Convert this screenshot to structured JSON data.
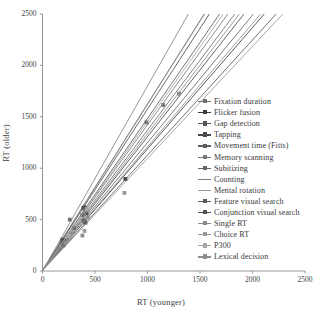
{
  "chart_data": {
    "type": "line",
    "title": "",
    "xlabel": "RT (younger)",
    "ylabel": "RT (older)",
    "xlim": [
      0,
      2500
    ],
    "ylim": [
      0,
      2500
    ],
    "xticks": [
      0,
      500,
      1000,
      1500,
      2000,
      2500
    ],
    "yticks": [
      0,
      500,
      1000,
      1500,
      2000,
      2500
    ],
    "grid": false,
    "legend_position": "right-inside",
    "series": [
      {
        "name": "Fixation duration",
        "color": "#6f6f6f",
        "slope": 1.36,
        "intercept": 10,
        "x_end": 300,
        "points": [
          [
            260,
            500
          ],
          [
            300,
            418
          ]
        ]
      },
      {
        "name": "Flicker fusion",
        "color": "#3c3c3c",
        "slope": 1.18,
        "intercept": 8,
        "x_end": 790,
        "points": [
          [
            190,
            280
          ],
          [
            400,
            480
          ],
          [
            790,
            895
          ]
        ]
      },
      {
        "name": "Gap detection",
        "color": "#555555",
        "slope": 1.62,
        "intercept": 5,
        "x_end": 400,
        "points": [
          [
            200,
            300
          ],
          [
            400,
            620
          ]
        ]
      },
      {
        "name": "Tapping",
        "color": "#4a4a4a",
        "slope": 1.3,
        "intercept": 6,
        "x_end": 420,
        "points": [
          [
            210,
            290
          ],
          [
            420,
            560
          ]
        ]
      },
      {
        "name": "Movement time (Fitts)",
        "color": "#5e5e5e",
        "slope": 1.48,
        "intercept": 4,
        "x_end": 380,
        "points": [
          [
            180,
            270
          ],
          [
            380,
            545
          ]
        ]
      },
      {
        "name": "Memory scanning",
        "color": "#7a7a7a",
        "slope": 1.41,
        "intercept": 12,
        "x_end": 1150,
        "points": [
          [
            400,
            580
          ],
          [
            1150,
            1615
          ]
        ]
      },
      {
        "name": "Subitizing",
        "color": "#666666",
        "slope": 1.24,
        "intercept": 9,
        "x_end": 990,
        "points": [
          [
            390,
            495
          ],
          [
            990,
            1445
          ]
        ]
      },
      {
        "name": "Counting",
        "color": "#828282",
        "slope": 1.8,
        "intercept": 0,
        "x_end": 1390,
        "points": []
      },
      {
        "name": "Mental rotation",
        "color": "#9a9a9a",
        "slope": 1.62,
        "intercept": 0,
        "x_end": 1545,
        "points": []
      },
      {
        "name": "Feature visual search",
        "color": "#5a5a5a",
        "slope": 1.12,
        "intercept": 7,
        "x_end": 410,
        "points": [
          [
            200,
            250
          ],
          [
            410,
            470
          ]
        ]
      },
      {
        "name": "Conjunction visual search",
        "color": "#4f4f4f",
        "slope": 1.57,
        "intercept": 5,
        "x_end": 390,
        "points": [
          [
            190,
            305
          ],
          [
            390,
            615
          ]
        ]
      },
      {
        "name": "Single RT",
        "color": "#8b8b8b",
        "slope": 1.33,
        "intercept": 6,
        "x_end": 1300,
        "points": [
          [
            380,
            345
          ],
          [
            1300,
            1725
          ]
        ]
      },
      {
        "name": "Choice RT",
        "color": "#999999",
        "slope": 1.09,
        "intercept": 5,
        "x_end": 780,
        "points": [
          [
            400,
            390
          ],
          [
            780,
            760
          ]
        ]
      },
      {
        "name": "P300",
        "color": "#a6a6a6",
        "slope": 1.45,
        "intercept": 4,
        "x_end": 420,
        "points": [
          [
            250,
            340
          ],
          [
            420,
            600
          ]
        ]
      },
      {
        "name": "Lexical decision",
        "color": "#8f8f8f",
        "slope": 1.2,
        "intercept": 8,
        "x_end": 430,
        "points": [
          [
            220,
            275
          ],
          [
            430,
            520
          ]
        ]
      }
    ]
  },
  "axes": {
    "x_tick_labels": [
      "0",
      "500",
      "1000",
      "1500",
      "2000",
      "2500"
    ],
    "y_tick_labels": [
      "0",
      "500",
      "1000",
      "1500",
      "2000",
      "2500"
    ],
    "x_axis_title": "RT (younger)",
    "y_axis_title": "RT (older)"
  },
  "legend": {
    "items": [
      "Fixation duration",
      "Flicker fusion",
      "Gap detection",
      "Tapping",
      "Movement time (Fitts)",
      "Memory scanning",
      "Subitizing",
      "Counting",
      "Mental rotation",
      "Feature visual search",
      "Conjunction visual search",
      "Single RT",
      "Choice RT",
      "P300",
      "Lexical decision"
    ]
  },
  "style": {
    "axis_color": "#8a8a8a",
    "text_color": "#3f3f3f",
    "background": "#ffffff"
  }
}
